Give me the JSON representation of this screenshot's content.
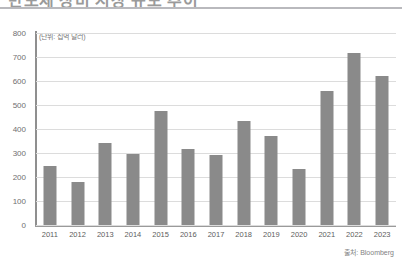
{
  "headline": {
    "text_partial": "반도체 장비 시장 규모 추이"
  },
  "chart_data": {
    "type": "bar",
    "title": "",
    "subtitle": "",
    "unit_label": "(단위: 십억 달러)",
    "xlabel": "",
    "ylabel": "",
    "ylim": [
      0,
      800
    ],
    "ytick_step": 100,
    "yticks": [
      "800",
      "700",
      "600",
      "500",
      "400",
      "300",
      "200",
      "100",
      "0"
    ],
    "grid": true,
    "legend": "none",
    "categories": [
      "2011",
      "2012",
      "2013",
      "2014",
      "2015",
      "2016",
      "2017",
      "2018",
      "2019",
      "2020",
      "2021",
      "2022",
      "2023"
    ],
    "values": [
      245,
      180,
      340,
      295,
      475,
      315,
      290,
      435,
      370,
      235,
      560,
      715,
      620
    ],
    "bar_color": "#8a8a8a",
    "grid_color": "#dcdcdc",
    "axis_color": "#8f8f8f",
    "source": "출처: Bloomberg"
  }
}
